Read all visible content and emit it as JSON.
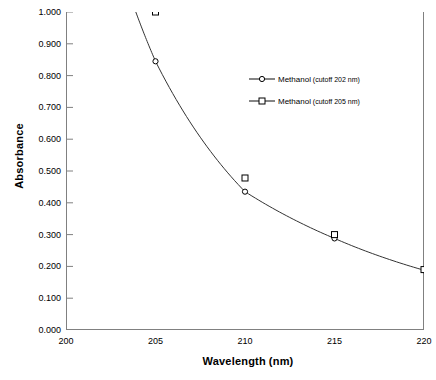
{
  "chart_data": {
    "type": "line",
    "title": "",
    "xlabel": "Wavelength",
    "xunit": "(nm)",
    "ylabel": "Absorbance",
    "xlim": [
      200,
      220
    ],
    "ylim": [
      0.0,
      1.0
    ],
    "xticks": [
      "200",
      "205",
      "210",
      "215",
      "220"
    ],
    "yticks": [
      "0.000",
      "0.100",
      "0.200",
      "0.300",
      "0.400",
      "0.500",
      "0.600",
      "0.700",
      "0.800",
      "0.900",
      "1.000"
    ],
    "grid": false,
    "legend_position": "right-upper",
    "x": [
      205,
      210,
      215,
      220
    ],
    "series": [
      {
        "name": "Methanol",
        "note": "(cutoff 202 nm)",
        "marker": "circle",
        "color": "#333333",
        "values": [
          0.845,
          0.435,
          0.288,
          0.188
        ],
        "curve_start_x": 203.9,
        "curve_start_y": 1.0
      },
      {
        "name": "Methanol",
        "note": "(cutoff 205 nm)",
        "marker": "square",
        "color": "#333333",
        "values": [
          1.0,
          0.478,
          0.3,
          0.19
        ],
        "curve_start_x": 205,
        "curve_start_y": 1.0
      }
    ]
  },
  "legend": {
    "entries": [
      {
        "name": "Methanol",
        "note": "(cutoff 202 nm)"
      },
      {
        "name": "Methanol",
        "note": "(cutoff 205 nm)"
      }
    ]
  },
  "axes": {
    "x_title": "Wavelength",
    "x_unit": "(nm)",
    "y_title": "Absorbance"
  },
  "colors": {
    "line": "#333333",
    "axis": "#808080",
    "text": "#000000",
    "background": "#ffffff"
  }
}
